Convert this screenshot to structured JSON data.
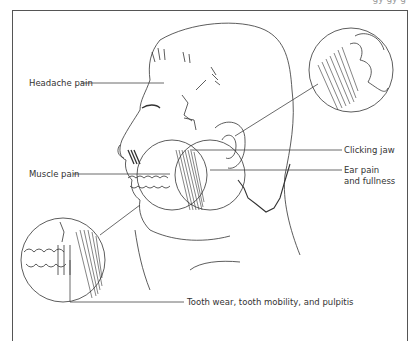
{
  "figure": {
    "header_fragment": "gy gy g",
    "labels": {
      "headache": "Headache pain",
      "muscle": "Muscle pain",
      "clicking": "Clicking jaw",
      "ear_line1": "Ear pain",
      "ear_line2": "and fullness",
      "tooth": "Tooth wear, tooth mobility, and pulpitis"
    },
    "insets": [
      {
        "name": "tmj-magnified-inset",
        "position": "top-right"
      },
      {
        "name": "teeth-magnified-inset",
        "position": "bottom-left"
      }
    ],
    "colors": {
      "line": "#333333",
      "frame": "#555555",
      "text": "#333333"
    }
  }
}
